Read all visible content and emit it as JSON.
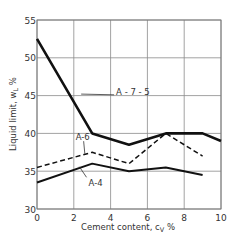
{
  "chart_data": {
    "type": "line",
    "title": "",
    "xlabel": "Cement content, c_v %",
    "ylabel": "Liquid limit, w_L %",
    "xlim": [
      0,
      10
    ],
    "ylim": [
      30,
      55
    ],
    "xticks": [
      0,
      2,
      4,
      6,
      8,
      10
    ],
    "yticks": [
      30,
      35,
      40,
      45,
      50,
      55
    ],
    "grid": true,
    "legend_position": "inline labels",
    "series": [
      {
        "name": "A-7-5",
        "style": "solid-thick",
        "x": [
          0,
          3,
          5,
          7,
          9,
          10
        ],
        "values": [
          52.5,
          40,
          38.5,
          40,
          40,
          39
        ]
      },
      {
        "name": "A-6",
        "style": "dashed",
        "x": [
          0,
          3,
          5,
          7,
          9
        ],
        "values": [
          35.5,
          37.5,
          36,
          40,
          37
        ]
      },
      {
        "name": "A-4",
        "style": "solid",
        "x": [
          0,
          3,
          5,
          7,
          9
        ],
        "values": [
          33.5,
          36,
          35,
          35.5,
          34.5
        ]
      }
    ],
    "annotations": [
      {
        "text": "A-7-5",
        "x": 4.3,
        "y": 45.5
      },
      {
        "text": "A-6",
        "x": 2.1,
        "y": 39.5
      },
      {
        "text": "A-4",
        "x": 2.8,
        "y": 33.4
      }
    ]
  },
  "labels": {
    "xlabel": "Cement content, c",
    "xlabel_sub": "V",
    "xlabel_unit": " %",
    "ylabel": "Liquid limit, w",
    "ylabel_sub": "L",
    "ylabel_unit": " %"
  }
}
